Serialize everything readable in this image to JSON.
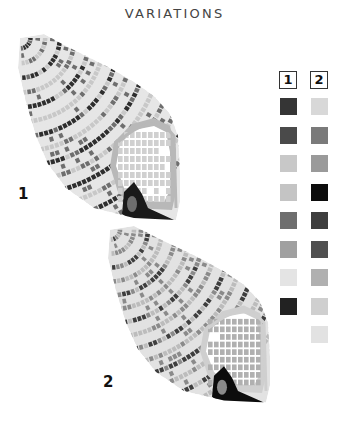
{
  "title": "VARIATIONS",
  "variations": [
    {
      "label": "1",
      "swatches": [
        "#353535",
        "#4a4a4a",
        "#c8c8c8",
        "#c4c4c4",
        "#6e6e6e",
        "#a0a0a0",
        "#e4e4e4",
        "#222222"
      ],
      "palette": {
        "dark": "#2e2e2e",
        "mid": "#6e6e6e",
        "light": "#c8c8c8",
        "pale": "#e6e6e6",
        "lip": "#b8b8b8",
        "mouth": "#d0d0d0",
        "canal": "#1a1a1a"
      }
    },
    {
      "label": "2",
      "swatches": [
        "#d8d8d8",
        "#7a7a7a",
        "#9a9a9a",
        "#0c0c0c",
        "#3e3e3e",
        "#505050",
        "#b0b0b0",
        "#cfcfcf",
        "#e2e2e2"
      ],
      "palette": {
        "dark": "#3e3e3e",
        "mid": "#8a8a8a",
        "light": "#bcbcbc",
        "pale": "#e2e2e2",
        "lip": "#cfcfcf",
        "mouth": "#b0b0b0",
        "canal": "#0c0c0c"
      }
    }
  ]
}
